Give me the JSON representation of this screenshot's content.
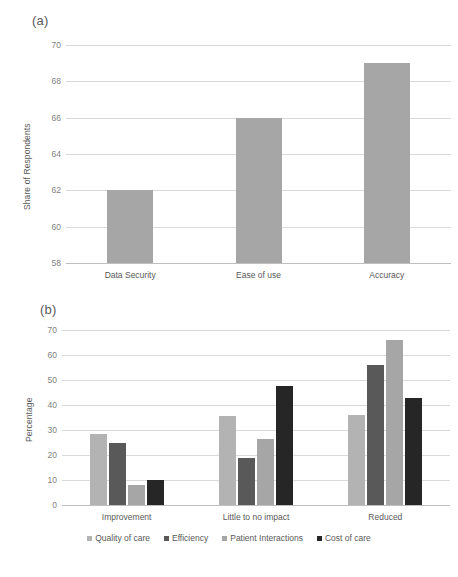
{
  "figure": {
    "background": "#ffffff",
    "panels": [
      {
        "id": "a",
        "label": "(a)"
      },
      {
        "id": "b",
        "label": "(b)"
      }
    ]
  },
  "chart_data": [
    {
      "type": "bar",
      "panel": "(a)",
      "title": "",
      "xlabel": "",
      "ylabel": "Share of Respondents",
      "categories": [
        "Data Security",
        "Ease of use",
        "Accuracy"
      ],
      "values": [
        62,
        66,
        69
      ],
      "ylim": [
        58,
        70
      ],
      "yticks": [
        58,
        60,
        62,
        64,
        66,
        68,
        70
      ],
      "bar_color": "#a6a6a6",
      "grid": true,
      "legend": "none"
    },
    {
      "type": "bar",
      "panel": "(b)",
      "title": "",
      "xlabel": "",
      "ylabel": "Percentage",
      "categories": [
        "Improvement",
        "Little to no impact",
        "Reduced"
      ],
      "series": [
        {
          "name": "Quality of care",
          "color": "#b3b3b3",
          "values": [
            28.5,
            35.5,
            36
          ]
        },
        {
          "name": "Efficiency",
          "color": "#595959",
          "values": [
            25,
            19,
            56
          ]
        },
        {
          "name": "Patient Interactions",
          "color": "#a6a6a6",
          "values": [
            8,
            26.5,
            66
          ]
        },
        {
          "name": "Cost of care",
          "color": "#262626",
          "values": [
            10,
            47.5,
            43
          ]
        }
      ],
      "ylim": [
        0,
        70
      ],
      "yticks": [
        0,
        10,
        20,
        30,
        40,
        50,
        60,
        70
      ],
      "grid": true,
      "legend": "bottom"
    }
  ]
}
